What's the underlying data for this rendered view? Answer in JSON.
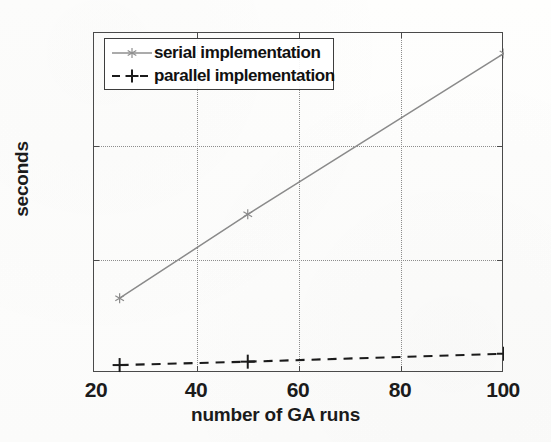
{
  "chart_data": {
    "type": "line",
    "title": "",
    "xlabel": "number of GA runs",
    "ylabel": "seconds",
    "xlim": [
      20,
      100
    ],
    "ylim": [
      0,
      150
    ],
    "xticks": [
      20,
      40,
      60,
      80,
      100
    ],
    "yticks": [
      0,
      50,
      100,
      150
    ],
    "grid": true,
    "legend_position": "top-left",
    "x": [
      25,
      50,
      100
    ],
    "series": [
      {
        "name": "serial implementation",
        "values": [
          33,
          70,
          141
        ],
        "linestyle": "solid",
        "marker": "asterisk",
        "color": "#8a8a8a"
      },
      {
        "name": "parallel implementation",
        "values": [
          3.5,
          5,
          8.5
        ],
        "linestyle": "dashed",
        "marker": "plus",
        "color": "#1b1b1b"
      }
    ]
  },
  "axes": {
    "xlabel": "number of GA runs",
    "ylabel": "seconds",
    "xtick_labels": [
      "20",
      "40",
      "60",
      "80",
      "100"
    ],
    "ytick_labels": [
      "0",
      "50",
      "100",
      "150"
    ]
  },
  "legend": {
    "entries": [
      {
        "label": "serial implementation"
      },
      {
        "label": "parallel implementation"
      }
    ]
  },
  "colors": {
    "axis": "#4a4a4a",
    "grid": "#8d8d8d",
    "serial_line": "#8a8a8a",
    "parallel_line": "#1b1b1b",
    "text": "#1b1b1b",
    "background": "#fdfdfc"
  }
}
